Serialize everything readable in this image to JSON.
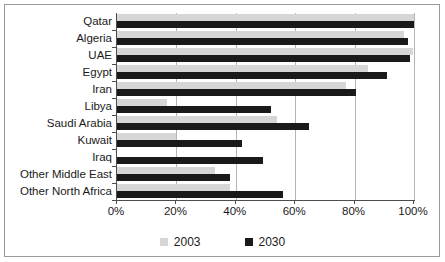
{
  "chart_data": {
    "type": "bar",
    "orientation": "horizontal",
    "title": "",
    "xlabel": "",
    "ylabel": "",
    "xlim": [
      0,
      100
    ],
    "xticks": [
      0,
      20,
      40,
      60,
      80,
      100
    ],
    "xtick_labels": [
      "0%",
      "20%",
      "40%",
      "60%",
      "80%",
      "100%"
    ],
    "grid": true,
    "legend_position": "bottom",
    "categories": [
      "Qatar",
      "Algeria",
      "UAE",
      "Egypt",
      "Iran",
      "Libya",
      "Saudi Arabia",
      "Kuwait",
      "Iraq",
      "Other Middle East",
      "Other North Africa"
    ],
    "series": [
      {
        "name": "2003",
        "color": "#d6d6d6",
        "values": [
          100,
          96.5,
          99.5,
          84.5,
          77,
          17,
          54,
          20,
          0,
          33,
          38
        ]
      },
      {
        "name": "2030",
        "color": "#1a1a1a",
        "values": [
          100,
          98,
          98.5,
          91,
          80.5,
          52,
          64.5,
          42,
          49,
          38,
          56
        ]
      }
    ]
  },
  "legend": {
    "items": [
      {
        "label": "2003",
        "swatch": "legend-swatch-2003"
      },
      {
        "label": "2030",
        "swatch": "legend-swatch-2030"
      }
    ]
  },
  "colors": {
    "series_2003": "#d6d6d6",
    "series_2030": "#1a1a1a",
    "axis": "#4d4d4d",
    "gridline": "#b5b5b5",
    "frame": "#9a9a9a",
    "background": "#ffffff"
  }
}
